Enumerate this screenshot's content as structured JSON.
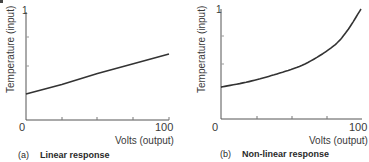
{
  "figures": [
    {
      "tag": "(a)",
      "title": "Linear response",
      "ylabel": "Temperature (input)",
      "xlabel": "Volts (output)",
      "y_top_label": "1",
      "x_min_label": "0",
      "x_max_label": "100"
    },
    {
      "tag": "(b)",
      "title": "Non-linear response",
      "ylabel": "Temperature (input)",
      "xlabel": "Volts (output)",
      "y_top_label": "1",
      "x_min_label": "0",
      "x_max_label": "100"
    }
  ],
  "chart_data": [
    {
      "type": "line",
      "title": "(a) Linear response",
      "xlabel": "Volts (output)",
      "ylabel": "Temperature (input)",
      "xlim": [
        0,
        100
      ],
      "ylim": [
        0,
        1
      ],
      "x_ticks": [
        0,
        25,
        50,
        75,
        100
      ],
      "x_tick_labels": [
        "0",
        "100"
      ],
      "y_tick_labels": [
        "1"
      ],
      "grid": false,
      "series": [
        {
          "name": "Linear response",
          "x": [
            0,
            25,
            50,
            75,
            100
          ],
          "y": [
            0.24,
            0.33,
            0.43,
            0.52,
            0.61
          ]
        }
      ]
    },
    {
      "type": "line",
      "title": "(b) Non-linear response",
      "xlabel": "Volts (output)",
      "ylabel": "Temperature (input)",
      "xlim": [
        0,
        100
      ],
      "ylim": [
        0,
        1
      ],
      "x_ticks": [
        0,
        25,
        50,
        75,
        100
      ],
      "x_tick_labels": [
        "0",
        "100"
      ],
      "y_tick_labels": [
        "1"
      ],
      "grid": false,
      "series": [
        {
          "name": "Non-linear response",
          "x": [
            0,
            20,
            40,
            60,
            80,
            90,
            100
          ],
          "y": [
            0.29,
            0.34,
            0.41,
            0.5,
            0.66,
            0.8,
            1.0
          ]
        }
      ]
    }
  ]
}
